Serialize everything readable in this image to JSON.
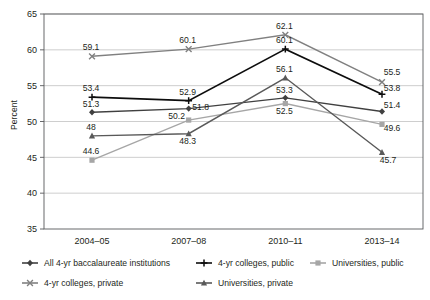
{
  "chart_data": {
    "type": "line",
    "title": "",
    "subtitle": "",
    "xlabel": "",
    "ylabel": "Percent",
    "categories": [
      "2004–05",
      "2007–08",
      "2010–11",
      "2013–14"
    ],
    "ylim": [
      35,
      65
    ],
    "yticks": [
      35,
      40,
      45,
      50,
      55,
      60,
      65
    ],
    "grid": true,
    "legend_position": "bottom",
    "series": [
      {
        "name": "All 4-yr baccalaureate institutions",
        "color": "#404040",
        "marker": "diamond",
        "values": [
          51.3,
          51.8,
          53.3,
          51.4
        ],
        "labels": [
          "51.3",
          "51.8",
          "53.3",
          "51.4"
        ]
      },
      {
        "name": "4-yr colleges, public",
        "color": "#0d0d0d",
        "marker": "plus",
        "values": [
          53.4,
          52.9,
          60.1,
          53.8
        ],
        "labels": [
          "53.4",
          "52.9",
          "60.1",
          "53.8"
        ]
      },
      {
        "name": "Universities, public",
        "color": "#a6a6a6",
        "marker": "square",
        "values": [
          44.6,
          50.2,
          52.5,
          49.6
        ],
        "labels": [
          "44.6",
          "50.2",
          "52.5",
          "49.6"
        ]
      },
      {
        "name": "4-yr colleges, private",
        "color": "#808080",
        "marker": "x",
        "values": [
          59.1,
          60.1,
          62.1,
          55.5
        ],
        "labels": [
          "59.1",
          "60.1",
          "62.1",
          "55.5"
        ]
      },
      {
        "name": "Universities, private",
        "color": "#595959",
        "marker": "triangle",
        "values": [
          48.0,
          48.3,
          56.1,
          45.7
        ],
        "labels": [
          "48",
          "48.3",
          "56.1",
          "45.7"
        ]
      }
    ]
  },
  "legend": {
    "rows": [
      [
        "All 4-yr baccalaureate institutions",
        "4-yr colleges, public",
        "Universities, public"
      ],
      [
        "4-yr colleges, private",
        "Universities, private"
      ]
    ]
  }
}
